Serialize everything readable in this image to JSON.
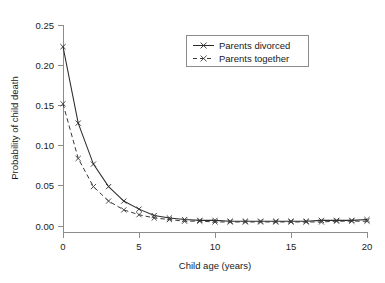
{
  "chart_data": {
    "type": "line",
    "title": "",
    "xlabel": "Child age (years)",
    "ylabel": "Probability of child death",
    "xlim": [
      0,
      20
    ],
    "ylim": [
      0,
      0.25
    ],
    "xticks": [
      "0",
      "5",
      "10",
      "15",
      "20"
    ],
    "xtick_values": [
      0,
      5,
      10,
      15,
      20
    ],
    "yticks": [
      "0.00",
      "0.05",
      "0.10",
      "0.15",
      "0.20",
      "0.25"
    ],
    "ytick_values": [
      0,
      0.05,
      0.1,
      0.15,
      0.2,
      0.25
    ],
    "grid": false,
    "legend_position": "top-right",
    "x": [
      0,
      1,
      2,
      3,
      4,
      5,
      6,
      7,
      8,
      9,
      10,
      11,
      12,
      13,
      14,
      15,
      16,
      17,
      18,
      19,
      20
    ],
    "series": [
      {
        "name": "Parents divorced",
        "style": "solid",
        "marker": "x",
        "color": "#2b2b2b",
        "values": [
          0.223,
          0.128,
          0.077,
          0.049,
          0.031,
          0.021,
          0.013,
          0.01,
          0.008,
          0.007,
          0.007,
          0.006,
          0.006,
          0.006,
          0.006,
          0.006,
          0.006,
          0.007,
          0.007,
          0.007,
          0.008
        ]
      },
      {
        "name": "Parents together",
        "style": "dashed",
        "marker": "x",
        "color": "#3a3a3a",
        "values": [
          0.152,
          0.084,
          0.049,
          0.031,
          0.02,
          0.014,
          0.01,
          0.008,
          0.006,
          0.006,
          0.005,
          0.005,
          0.005,
          0.005,
          0.005,
          0.005,
          0.005,
          0.005,
          0.006,
          0.006,
          0.006
        ]
      }
    ]
  },
  "legend": {
    "entries": [
      {
        "label": "Parents divorced"
      },
      {
        "label": "Parents together"
      }
    ]
  }
}
